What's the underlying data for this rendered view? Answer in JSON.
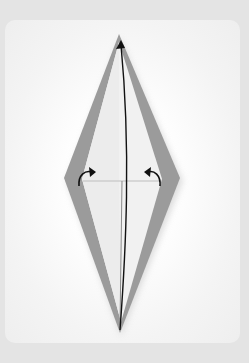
{
  "diagram": {
    "type": "origami-fold-step",
    "colors": {
      "page_background": "#e4e4e4",
      "card_background": "#ffffff",
      "paper_band": "#9a9a9a",
      "paper_inner": "#f2f2f2",
      "line": "#111111"
    },
    "shape": {
      "apex_top": [
        119,
        35
      ],
      "apex_bottom": [
        120,
        333
      ],
      "left_corner": [
        64,
        178
      ],
      "right_corner": [
        180,
        178
      ]
    },
    "arrows": [
      {
        "name": "vertical-fold-arrow",
        "direction": "up"
      },
      {
        "name": "left-curved-arrow",
        "direction": "right"
      },
      {
        "name": "right-curved-arrow",
        "direction": "left"
      }
    ]
  }
}
